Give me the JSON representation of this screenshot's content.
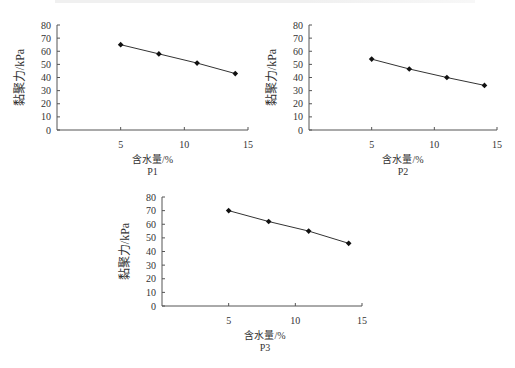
{
  "chart_data": [
    {
      "type": "line",
      "title": "P1",
      "xlabel": "含水量/%",
      "ylabel": "黏聚力/kPa",
      "x": [
        5,
        8,
        11,
        14
      ],
      "values": [
        65,
        58,
        51,
        43
      ],
      "xticks": [
        5,
        10,
        15
      ],
      "yticks": [
        0,
        10,
        20,
        30,
        40,
        50,
        60,
        70,
        80
      ],
      "xlim": [
        0,
        15
      ],
      "ylim": [
        0,
        80
      ],
      "grid": false,
      "legend": null
    },
    {
      "type": "line",
      "title": "P2",
      "xlabel": "含水量/%",
      "ylabel": "黏聚力/kPa",
      "x": [
        5,
        8,
        11,
        14
      ],
      "values": [
        54,
        46.5,
        40,
        34
      ],
      "xticks": [
        5,
        10,
        15
      ],
      "yticks": [
        0,
        10,
        20,
        30,
        40,
        50,
        60,
        70,
        80
      ],
      "xlim": [
        0,
        15
      ],
      "ylim": [
        0,
        80
      ],
      "grid": false,
      "legend": null
    },
    {
      "type": "line",
      "title": "P3",
      "xlabel": "含水量/%",
      "ylabel": "黏聚力/kPa",
      "x": [
        5,
        8,
        11,
        14
      ],
      "values": [
        70,
        62,
        55,
        46
      ],
      "xticks": [
        5,
        10,
        15
      ],
      "yticks": [
        0,
        10,
        20,
        30,
        40,
        50,
        60,
        70,
        80
      ],
      "xlim": [
        0,
        15
      ],
      "ylim": [
        0,
        80
      ],
      "grid": false,
      "legend": null
    }
  ],
  "layout": [
    {
      "left": 0,
      "top": 15,
      "axis_x0": 57,
      "axis_x1": 248,
      "axis_ytop": 25,
      "axis_ybot": 130,
      "title_y": 175
    },
    {
      "left": 0,
      "top": 15,
      "axis_x0": 309,
      "axis_x1": 497,
      "axis_ytop": 25,
      "axis_ybot": 130,
      "title_y": 175
    },
    {
      "left": 0,
      "top": 0,
      "axis_x0": 162,
      "axis_x1": 362,
      "axis_ytop": 197,
      "axis_ybot": 306,
      "title_y": 351
    }
  ],
  "colors": {
    "axis": "#555555",
    "line": "#333333",
    "marker": "#111111",
    "text": "#333333"
  }
}
